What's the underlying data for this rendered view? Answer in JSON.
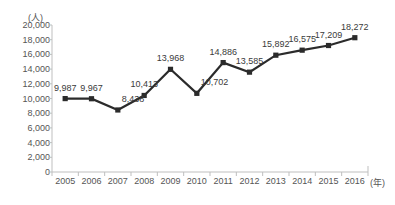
{
  "chart_data": {
    "type": "line",
    "title": "",
    "xlabel": "(年)",
    "ylabel": "(人)",
    "categories": [
      "2005",
      "2006",
      "2007",
      "2008",
      "2009",
      "2010",
      "2011",
      "2012",
      "2013",
      "2014",
      "2015",
      "2016"
    ],
    "values": [
      9987,
      9967,
      8438,
      10413,
      13968,
      10702,
      14886,
      13585,
      15892,
      16575,
      17209,
      18272
    ],
    "data_labels": [
      "9,987",
      "9,967",
      "8,438",
      "10,413",
      "13,968",
      "10,702",
      "14,886",
      "13,585",
      "15,892",
      "16,575",
      "17,209",
      "18,272"
    ],
    "ylim": [
      0,
      20000
    ],
    "ytick_step": 2000,
    "ytick_labels": [
      "20,000",
      "18,000",
      "16,000",
      "14,000",
      "12,000",
      "10,000",
      "8,000",
      "6,000",
      "4,000",
      "2,000",
      "0"
    ],
    "ytick_values": [
      20000,
      18000,
      16000,
      14000,
      12000,
      10000,
      8000,
      6000,
      4000,
      2000,
      0
    ],
    "grid": false,
    "legend": "none",
    "marker": "square",
    "line_color": "#2b2b2b",
    "marker_color": "#2b2b2b",
    "axis_color": "#bfbfbf",
    "label_color": "#555555"
  },
  "clipped_text": {
    "top": "",
    "bottom": ""
  }
}
